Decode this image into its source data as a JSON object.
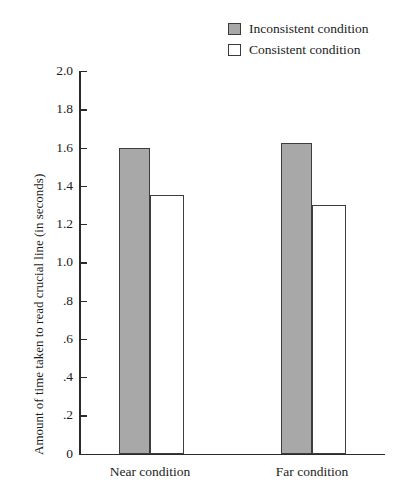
{
  "chart_data": {
    "type": "bar",
    "title": "",
    "subtitle": "",
    "xlabel": "",
    "ylabel": "Amount of time taken to read crucial line (in seconds)",
    "categories": [
      "Near condition",
      "Far condition"
    ],
    "series": [
      {
        "name": "Inconsistent condition",
        "color": "#a8a8a8",
        "values": [
          1.6,
          1.625
        ]
      },
      {
        "name": "Consistent condition",
        "color": "#ffffff",
        "values": [
          1.35,
          1.3
        ]
      }
    ],
    "ylim": [
      0,
      2.0
    ],
    "ytick_values": [
      0,
      0.2,
      0.4,
      0.6,
      0.8,
      1.0,
      1.2,
      1.4,
      1.6,
      1.8,
      2.0
    ],
    "ytick_labels": [
      "0",
      ".2",
      ".4",
      ".6",
      ".8",
      "1.0",
      "1.2",
      "1.4",
      "1.6",
      "1.8",
      "2.0"
    ],
    "grid": false,
    "legend_position": "top-right",
    "bar_border_color": "#3d3d3d",
    "axis_color": "#2a2a2a"
  },
  "legend": {
    "items": [
      {
        "label": "Inconsistent condition",
        "swatch": "#a8a8a8"
      },
      {
        "label": "Consistent condition",
        "swatch": "#ffffff"
      }
    ]
  }
}
